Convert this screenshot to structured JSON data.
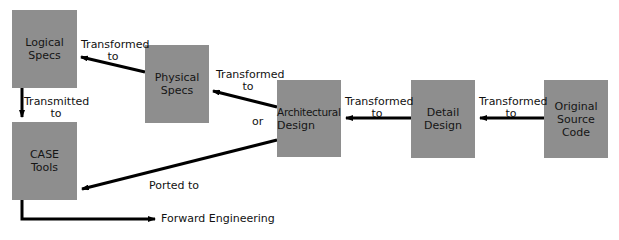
{
  "nodes": {
    "logical_specs": {
      "line1": "Logical",
      "line2": "Specs"
    },
    "physical_specs": {
      "line1": "Physical",
      "line2": "Specs"
    },
    "architectural_design": {
      "line1": "Architectural",
      "line2": "Design"
    },
    "detail_design": {
      "line1": "Detail",
      "line2": "Design"
    },
    "original_source_code": {
      "line1": "Original",
      "line2": "Source",
      "line3": "Code"
    },
    "case_tools": {
      "line1": "CASE",
      "line2": "Tools"
    }
  },
  "edges": {
    "physical_to_logical": {
      "line1": "Transformed",
      "line2": "to"
    },
    "arch_to_physical": {
      "line1": "Transformed",
      "line2": "to"
    },
    "detail_to_arch": {
      "line1": "Transformed",
      "line2": "to"
    },
    "source_to_detail": {
      "line1": "Transformed",
      "line2": "to"
    },
    "logical_to_case": {
      "line1": "Transmitted",
      "line2": "to"
    },
    "arch_to_case": {
      "label": "Ported to"
    },
    "or_label": "or",
    "case_to_forward": {
      "label": "Forward Engineering"
    }
  },
  "colors": {
    "box_fill": "#8e8e8e",
    "arrow": "#000000"
  }
}
